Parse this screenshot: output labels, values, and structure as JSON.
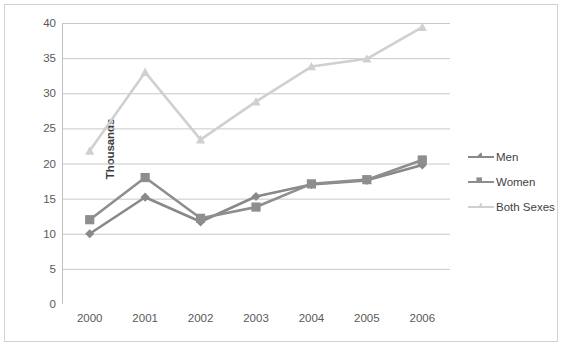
{
  "chart_data": {
    "type": "line",
    "title": "",
    "xlabel": "",
    "ylabel": "Thousands",
    "categories": [
      "2000",
      "2001",
      "2002",
      "2003",
      "2004",
      "2005",
      "2006"
    ],
    "ylim": [
      0,
      40
    ],
    "yticks": [
      0,
      5,
      10,
      15,
      20,
      25,
      30,
      35,
      40
    ],
    "ytick_labels": [
      "0",
      "5",
      "10",
      "15",
      "20",
      "25",
      "30",
      "35",
      "40"
    ],
    "grid": "horizontal",
    "legend_position": "right",
    "series": [
      {
        "name": "Men",
        "marker": "diamond",
        "color": "#898989",
        "values": [
          10.0,
          15.2,
          11.7,
          15.3,
          17.0,
          17.6,
          19.8
        ]
      },
      {
        "name": "Women",
        "marker": "square",
        "color": "#8e8e8e",
        "values": [
          12.0,
          18.0,
          12.2,
          13.8,
          17.1,
          17.7,
          20.5
        ]
      },
      {
        "name": "Both Sexes",
        "marker": "triangle",
        "color": "#d0d0d0",
        "values": [
          21.8,
          33.0,
          23.4,
          28.8,
          33.8,
          34.9,
          39.4
        ]
      }
    ]
  },
  "legend": {
    "items": [
      {
        "label": "Men"
      },
      {
        "label": "Women"
      },
      {
        "label": "Both Sexes"
      }
    ]
  },
  "axes": {
    "y_axis_title": "Thousands",
    "axis_color": "#bfbfbf",
    "grid_color": "#c8c8c8",
    "tick_text_color": "#595959"
  },
  "frame": {
    "border_color": "#d2d2d2",
    "background": "#ffffff"
  }
}
